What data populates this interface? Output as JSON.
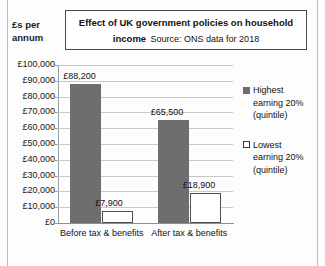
{
  "chart_data": {
    "type": "bar",
    "title": "Effect of UK government policies on household income",
    "subtitle": "Source: ONS data for 2018",
    "xlabel": "",
    "ylabel": "£s per annum",
    "ylabel_line1": "£s per",
    "ylabel_line2": "annum",
    "categories": [
      "Before tax & benefits",
      "After tax & benefits"
    ],
    "series": [
      {
        "name": "Highest earning 20% (quintile)",
        "values": [
          88200,
          65500
        ],
        "labels": [
          "£88,200",
          "£65,500"
        ],
        "color": "#6e6e6e",
        "marker": "filled"
      },
      {
        "name": "Lowest earning 20% (quintile)",
        "values": [
          7900,
          18900
        ],
        "labels": [
          "£7,900",
          "£18,900"
        ],
        "color": "#ffffff",
        "marker": "hollow"
      }
    ],
    "ylim": [
      0,
      100000
    ],
    "ytick_values": [
      100000,
      90000,
      80000,
      70000,
      60000,
      50000,
      40000,
      30000,
      20000,
      10000,
      0
    ],
    "ytick_labels": [
      "£100,000",
      "£90,000",
      "£80,000",
      "£70,000",
      "£60,000",
      "£50,000",
      "£40,000",
      "£30,000",
      "£20,000",
      "£10,000",
      "£0"
    ],
    "grid": true,
    "legend_position": "right",
    "legend": [
      {
        "marker": "filled",
        "line1": "Highest",
        "line2": "earning 20%",
        "line3": "(quintile)"
      },
      {
        "marker": "hollow",
        "line1": "Lowest",
        "line2": "earning 20%",
        "line3": "(quintile)"
      }
    ]
  }
}
